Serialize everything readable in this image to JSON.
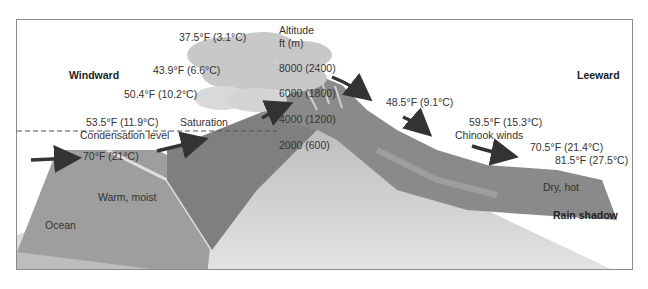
{
  "sides": {
    "windward": "Windward",
    "leeward": "Leeward"
  },
  "altitude": {
    "heading_line1": "Altitude",
    "heading_line2": "ft (m)",
    "levels": [
      "8000 (2400)",
      "6000 (1800)",
      "4000 (1200)",
      "2000 (600)"
    ]
  },
  "windward_temps": [
    "37.5°F (3.1°C)",
    "43.9°F (6.6°C)",
    "50.4°F (10.2°C)",
    "53.5°F (11.9°C)",
    "70°F (21°C)"
  ],
  "leeward_temps": [
    "48.5°F (9.1°C)",
    "59.5°F (15.3°C)",
    "70.5°F (21.4°C)",
    "81.5°F (27.5°C)"
  ],
  "labels": {
    "condensation": "Condensation level",
    "saturation": "Saturation",
    "chinook": "Chinook winds",
    "warm_moist": "Warm, moist",
    "ocean": "Ocean",
    "dry_hot": "Dry, hot",
    "rain_shadow": "Rain shadow"
  },
  "colors": {
    "ground_light": "#d9d9d9",
    "mountain_dark": "#8c8c8c",
    "forest": "#7a7a7a",
    "ocean": "#9a9a9a",
    "cloud": "#c8c8c8",
    "arrow": "#333333"
  }
}
